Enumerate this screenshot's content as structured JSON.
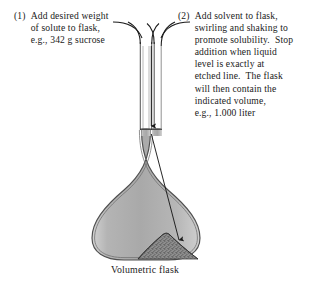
{
  "figure": {
    "caption": "Volumetric flask",
    "background_color": "#ffffff",
    "ink_color": "#1a1a1a",
    "glass_fill_color": "#b3b3b3",
    "glass_outline_color": "#4d4d4d",
    "solute_color": "#7a7a7a"
  },
  "instructions": [
    {
      "number": "(1)",
      "lines": [
        "Add desired weight",
        "of solute to flask,",
        "e.g., 342 g sucrose"
      ],
      "text": "Add desired weight of solute to flask, e.g., 342 g sucrose"
    },
    {
      "number": "(2)",
      "lines": [
        "Add solvent to flask,",
        "swirling and shaking to",
        "promote solubility.  Stop",
        "addition when liquid",
        "level is exactly at",
        "etched line.  The flask",
        "will then contain the",
        "indicated volume,",
        "e.g., 1.000 liter"
      ],
      "text": "Add solvent to flask, swirling and shaking to promote solubility. Stop addition when liquid level is exactly at etched line. The flask will then contain the indicated volume, e.g., 1.000 liter"
    }
  ],
  "diagram": {
    "flask_label": "volumetric-flask",
    "parts": [
      "neck",
      "neck-lip",
      "etched-line",
      "bulb",
      "solute-pile",
      "liquid-level-arrow"
    ]
  }
}
